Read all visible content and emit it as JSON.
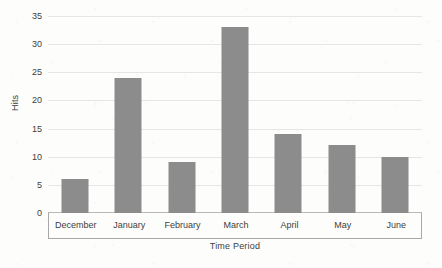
{
  "chart_data": {
    "type": "bar",
    "title": "",
    "subtitle": "",
    "xlabel": "Time Period",
    "ylabel": "Hits",
    "categories": [
      "December",
      "January",
      "February",
      "March",
      "April",
      "May",
      "June"
    ],
    "values": [
      6,
      24,
      9,
      33,
      14,
      12,
      10
    ],
    "series": [
      {
        "name": "Hits",
        "values": [
          6,
          24,
          9,
          33,
          14,
          12,
          10
        ]
      }
    ],
    "ylim": [
      0,
      35
    ],
    "ytick_labels": [
      "0",
      "5",
      "10",
      "15",
      "20",
      "25",
      "30",
      "35"
    ],
    "ytick_values": [
      0,
      5,
      10,
      15,
      20,
      25,
      30,
      35
    ],
    "grid": true,
    "legend": false,
    "legend_position": "none",
    "bar_color": "#8c8c8c",
    "gridline_color": "#e6e6e6",
    "axis_color": "#a8a8a8",
    "background_color": "#fdfdfc",
    "text_color": "#3d3d3d",
    "annotations": []
  }
}
